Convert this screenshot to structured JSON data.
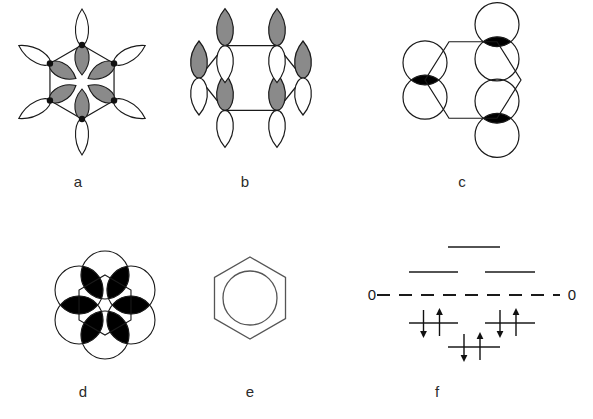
{
  "figure": {
    "background_color": "#ffffff",
    "line_color": "#1a1a1a",
    "shaded_lobe_color": "#8a8a8a",
    "unshaded_lobe_color": "#ffffff",
    "label_color": "#2b2b2b"
  },
  "panels": [
    {
      "id": "a",
      "label": "a",
      "caption_x": 78,
      "caption_y": 183,
      "kind": "in-plane-p-orbital-ring",
      "center_x": 82,
      "center_y": 82,
      "ring_radius": 37,
      "vertices": 6,
      "inner_lobe_shaded": true,
      "outer_lobe_shaded": false
    },
    {
      "id": "b",
      "label": "b",
      "caption_x": 245,
      "caption_y": 183,
      "kind": "perpendicular-p-orbitals-on-hexagon",
      "center_x": 251,
      "center_y": 80,
      "ring_radius": 52,
      "vertices": 6,
      "top_lobe_shaded": true,
      "bottom_lobe_shaded": false
    },
    {
      "id": "c",
      "label": "c",
      "caption_x": 462,
      "caption_y": 183,
      "kind": "overlap-circles-alternating",
      "center_x": 470,
      "center_y": 80,
      "ring_radius": 48,
      "circle_radius": 22,
      "overlap_fill": "#000000",
      "paired_vertices": 3
    },
    {
      "id": "d",
      "label": "d",
      "caption_x": 83,
      "caption_y": 393,
      "kind": "delocalized-overlap-ring",
      "center_x": 105,
      "center_y": 300,
      "ring_radius": 30,
      "circle_radius": 24,
      "overlap_fill": "#000000",
      "circles": 6
    },
    {
      "id": "e",
      "label": "e",
      "caption_x": 250,
      "caption_y": 393,
      "kind": "benzene-circle-symbol",
      "center_x": 250,
      "center_y": 298,
      "hexagon_radius": 41,
      "inner_circle_radius": 27
    },
    {
      "id": "f",
      "label": "f",
      "caption_x": 437,
      "caption_y": 393,
      "kind": "molecular-orbital-energy-diagram"
    }
  ],
  "energy_diagram": {
    "zero_label_left": "0",
    "zero_label_right": "0",
    "zero_line_y": 295,
    "zero_line_x_start": 377,
    "zero_line_x_end": 560,
    "zero_line_style": "dashed",
    "levels": [
      {
        "name": "antibonding-top",
        "degeneracy": 1,
        "x_start": 448,
        "x_end": 500,
        "y": 247,
        "electrons": 0,
        "label": "b2g"
      },
      {
        "name": "antibonding-left",
        "degeneracy": 2,
        "x_start": 409,
        "x_end": 458,
        "y": 272,
        "electrons": 0,
        "label": "e2u"
      },
      {
        "name": "antibonding-right",
        "degeneracy": 2,
        "x_start": 485,
        "x_end": 535,
        "y": 272,
        "electrons": 0,
        "label": "e2u"
      },
      {
        "name": "bonding-left",
        "degeneracy": 2,
        "x_start": 409,
        "x_end": 458,
        "y": 323,
        "electrons": 2,
        "label": "e1g"
      },
      {
        "name": "bonding-right",
        "degeneracy": 2,
        "x_start": 485,
        "x_end": 535,
        "y": 323,
        "electrons": 2,
        "label": "e1g"
      },
      {
        "name": "bonding-lowest",
        "degeneracy": 1,
        "x_start": 448,
        "x_end": 500,
        "y": 347,
        "electrons": 2,
        "label": "a2u"
      }
    ],
    "total_pi_electrons": 6,
    "arrow_up": "up-spin",
    "arrow_down": "down-spin"
  }
}
